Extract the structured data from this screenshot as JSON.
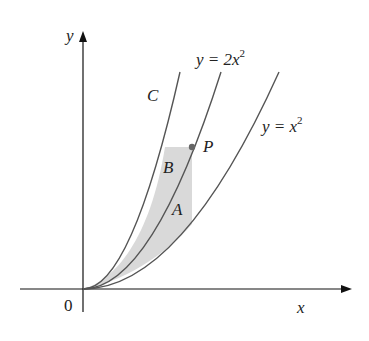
{
  "figure": {
    "axes": {
      "x_label": "x",
      "y_label": "y",
      "origin_label": "0"
    },
    "curves": [
      {
        "name": "C",
        "label": "C"
      },
      {
        "name": "y=2x^2",
        "label_main": "y = 2x",
        "label_sup": "2"
      },
      {
        "name": "y=x^2",
        "label_main": "y = x",
        "label_sup": "2"
      }
    ],
    "regions": {
      "A": "A",
      "B": "B"
    },
    "point": {
      "label": "P"
    },
    "colors": {
      "shade": "#d9d9d9",
      "curve": "#555555",
      "point": "#666666",
      "axis": "#111111"
    }
  }
}
